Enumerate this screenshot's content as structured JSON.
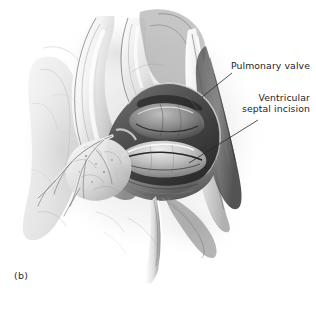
{
  "figure": {
    "caption": "(b)",
    "background_color": "#ffffff",
    "ink_color": "#1d1d1f",
    "style": "grayscale medical pencil illustration"
  },
  "annotations": [
    {
      "id": "pulmonary-valve",
      "label": "Pulmonary valve",
      "lines": [
        "Pulmonary valve"
      ],
      "leader": {
        "x1": 232,
        "y1": 73,
        "x2": 202,
        "y2": 97
      }
    },
    {
      "id": "ventricular-septal-incision",
      "label": "Ventricular septal incision",
      "lines": [
        "Ventricular",
        "septal incision"
      ],
      "leader": {
        "x1": 258,
        "y1": 120,
        "x2": 189,
        "y2": 163
      }
    }
  ],
  "palette": {
    "paper": "#ffffff",
    "tone_lightest": "#f2f2f2",
    "tone_light": "#d8d8d8",
    "tone_mid": "#a9a9a9",
    "tone_dark": "#6d6d6d",
    "tone_darker": "#3f3f3f",
    "tone_darkest": "#1c1c1c",
    "text": "#1d1d1f"
  }
}
